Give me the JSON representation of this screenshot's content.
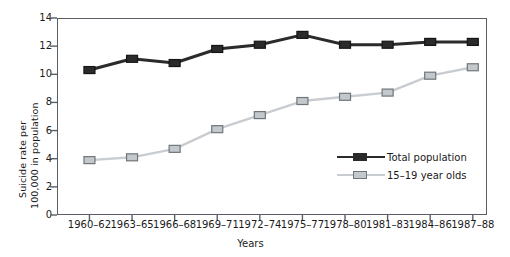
{
  "chart_data": {
    "type": "line",
    "title": "",
    "xlabel": "Years",
    "ylabel": "Suicide rate per 100,000 in population",
    "ylabel_lines": [
      "Suicide rate per",
      "100,000 in population"
    ],
    "categories": [
      "1960–62",
      "1963–65",
      "1966–68",
      "1969–71",
      "1972–74",
      "1975–77",
      "1978–80",
      "1981–83",
      "1984–86",
      "1987–88"
    ],
    "yticks": [
      0,
      2,
      4,
      6,
      8,
      10,
      12,
      14
    ],
    "ylim": [
      0,
      14
    ],
    "grid": false,
    "legend_position": "inside-lower-right",
    "series": [
      {
        "name": "Total population",
        "color": "#2b2b2b",
        "marker": "square-filled",
        "values": [
          10.3,
          11.1,
          10.8,
          11.8,
          12.1,
          12.8,
          12.1,
          12.1,
          12.3,
          12.3
        ]
      },
      {
        "name": "15–19 year olds",
        "color": "#c9cdd1",
        "marker": "square-open",
        "values": [
          3.9,
          4.1,
          4.7,
          6.1,
          7.1,
          8.1,
          8.4,
          8.7,
          9.9,
          10.5
        ]
      }
    ]
  },
  "axis": {
    "y_title_line1": "Suicide rate per",
    "y_title_line2": "100,000 in population",
    "x_title": "Years"
  }
}
